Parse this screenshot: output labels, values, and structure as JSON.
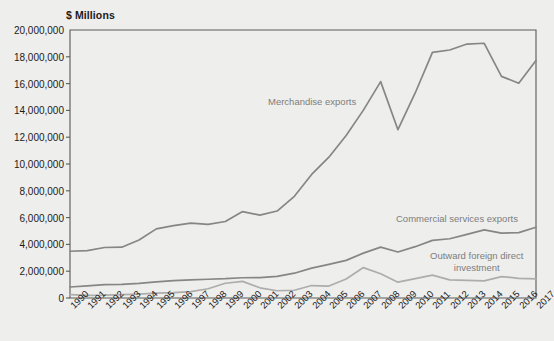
{
  "chart_data": {
    "type": "line",
    "title": "",
    "unit_label": "$ Millions",
    "xlabel": "",
    "ylabel": "$ Millions",
    "ylim": [
      0,
      20000000
    ],
    "ytick_step": 2000000,
    "grid": false,
    "legend_position": "inline-annotations",
    "categories": [
      "1990",
      "1991",
      "1992",
      "1993",
      "1994",
      "1995",
      "1996",
      "1997",
      "1998",
      "1999",
      "2000",
      "2001",
      "2002",
      "2003",
      "2004",
      "2005",
      "2006",
      "2007",
      "2008",
      "2009",
      "2010",
      "2011",
      "2012",
      "2013",
      "2014",
      "2015",
      "2016",
      "2017"
    ],
    "ytick_labels": [
      "0",
      "2,000,000",
      "4,000,000",
      "6,000,000",
      "8,000,000",
      "10,000,000",
      "12,000,000",
      "14,000,000",
      "16,000,000",
      "18,000,000",
      "20,000,000"
    ],
    "ytick_values": [
      0,
      2000000,
      4000000,
      6000000,
      8000000,
      10000000,
      12000000,
      14000000,
      16000000,
      18000000,
      20000000
    ],
    "series": [
      {
        "name": "Merchandise exports",
        "color": "#868686",
        "label_x": 268,
        "label_y": 96,
        "values": [
          3490000,
          3530000,
          3770000,
          3790000,
          4330000,
          5160000,
          5400000,
          5590000,
          5500000,
          5710000,
          6450000,
          6190000,
          6490000,
          7590000,
          9220000,
          10510000,
          12130000,
          14020000,
          16150000,
          12560000,
          15300000,
          18330000,
          18510000,
          18950000,
          19010000,
          16540000,
          16030000,
          17730000
        ]
      },
      {
        "name": "Commercial services exports",
        "color": "#868686",
        "label_x": 396,
        "label_y": 213,
        "values": [
          820000,
          900000,
          1000000,
          1010000,
          1090000,
          1200000,
          1290000,
          1350000,
          1400000,
          1440000,
          1510000,
          1520000,
          1620000,
          1850000,
          2230000,
          2510000,
          2810000,
          3350000,
          3800000,
          3430000,
          3830000,
          4300000,
          4420000,
          4750000,
          5080000,
          4840000,
          4880000,
          5280000
        ]
      },
      {
        "name": "Outward foreign direct investment",
        "color": "#adadad",
        "label_x": 430,
        "label_y": 250,
        "label_lines": [
          "Outward foreign direct",
          "investment"
        ],
        "values": [
          245000,
          200000,
          210000,
          250000,
          290000,
          360000,
          400000,
          480000,
          690000,
          1100000,
          1240000,
          760000,
          540000,
          580000,
          930000,
          890000,
          1420000,
          2270000,
          1810000,
          1180000,
          1440000,
          1710000,
          1350000,
          1320000,
          1280000,
          1600000,
          1470000,
          1430000
        ]
      }
    ]
  },
  "plot_area": {
    "left": 70,
    "top": 30,
    "right": 536,
    "bottom": 298,
    "frame_color": "#5a5a5a"
  }
}
